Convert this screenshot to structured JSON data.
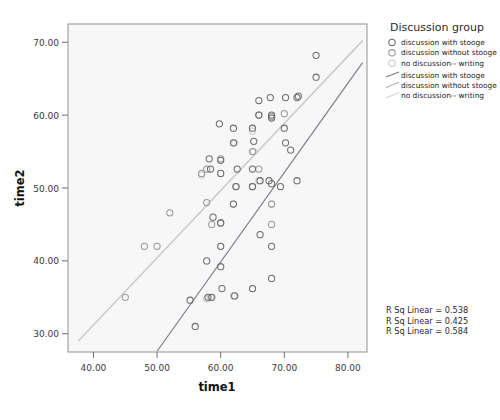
{
  "chart_data": {
    "type": "scatter",
    "title": "",
    "xlabel": "time1",
    "ylabel": "time2",
    "xlim": [
      36,
      83
    ],
    "ylim": [
      27.5,
      72.5
    ],
    "xticks": [
      "40.00",
      "50.00",
      "60.00",
      "70.00",
      "80.00"
    ],
    "xtick_values": [
      40,
      50,
      60,
      70,
      80
    ],
    "yticks": [
      "30.00",
      "40.00",
      "50.00",
      "60.00",
      "70.00"
    ],
    "ytick_values": [
      30,
      40,
      50,
      60,
      70
    ],
    "grid": false,
    "legend_position": "right",
    "legend_title": "Discussion group",
    "series": [
      {
        "name": "discussion with stooge",
        "marker": "open-circle",
        "color": "#6e6e6e",
        "points": [
          [
            56.0,
            31.0
          ],
          [
            55.2,
            34.6
          ],
          [
            58.0,
            35.0
          ],
          [
            58.6,
            35.0
          ],
          [
            60.2,
            36.2
          ],
          [
            62.2,
            35.2
          ],
          [
            65.0,
            36.2
          ],
          [
            68.0,
            37.6
          ],
          [
            57.8,
            40.0
          ],
          [
            60.0,
            39.2
          ],
          [
            60.0,
            42.0
          ],
          [
            68.0,
            42.0
          ],
          [
            66.2,
            43.6
          ],
          [
            60.0,
            45.2
          ],
          [
            58.8,
            46.0
          ],
          [
            62.0,
            47.8
          ],
          [
            62.4,
            50.2
          ],
          [
            65.0,
            50.2
          ],
          [
            66.2,
            51.0
          ],
          [
            67.6,
            51.0
          ],
          [
            68.0,
            50.6
          ],
          [
            69.4,
            50.2
          ],
          [
            72.0,
            51.0
          ],
          [
            60.0,
            52.0
          ],
          [
            62.6,
            52.6
          ],
          [
            65.0,
            52.6
          ],
          [
            58.4,
            52.6
          ],
          [
            60.0,
            53.8
          ],
          [
            58.2,
            54.0
          ],
          [
            62.0,
            56.2
          ],
          [
            65.2,
            56.4
          ],
          [
            70.2,
            56.2
          ],
          [
            59.8,
            58.8
          ],
          [
            62.0,
            58.2
          ],
          [
            65.0,
            58.2
          ],
          [
            70.0,
            58.2
          ],
          [
            66.0,
            60.0
          ],
          [
            68.0,
            60.0
          ],
          [
            68.0,
            59.6
          ],
          [
            71.0,
            55.2
          ],
          [
            66.0,
            62.0
          ],
          [
            67.8,
            62.4
          ],
          [
            70.2,
            62.4
          ],
          [
            72.0,
            62.4
          ],
          [
            72.2,
            62.6
          ],
          [
            75.0,
            65.2
          ],
          [
            75.0,
            68.2
          ]
        ]
      },
      {
        "name": "discussion without stooge",
        "marker": "open-circle",
        "color": "#9a9a9a",
        "points": [
          [
            45.0,
            35.0
          ],
          [
            48.0,
            42.0
          ],
          [
            50.0,
            42.0
          ],
          [
            52.0,
            46.6
          ],
          [
            57.8,
            48.0
          ],
          [
            58.6,
            45.0
          ],
          [
            60.0,
            45.2
          ],
          [
            57.0,
            52.0
          ],
          [
            57.8,
            52.6
          ],
          [
            60.0,
            54.0
          ],
          [
            62.4,
            50.2
          ],
          [
            65.0,
            50.2
          ],
          [
            65.0,
            55.0
          ],
          [
            66.0,
            52.6
          ],
          [
            68.0,
            45.0
          ],
          [
            68.0,
            47.8
          ],
          [
            66.0,
            60.0
          ],
          [
            68.0,
            59.8
          ],
          [
            70.0,
            60.2
          ]
        ]
      },
      {
        "name": "no discussion-- writing",
        "marker": "open-circle",
        "color": "#c9c9c9",
        "points": [
          [
            57.8,
            34.8
          ],
          [
            58.4,
            35.0
          ],
          [
            62.0,
            35.2
          ],
          [
            65.0,
            36.2
          ],
          [
            60.0,
            42.0
          ],
          [
            62.0,
            47.8
          ],
          [
            65.0,
            50.2
          ],
          [
            65.2,
            55.0
          ],
          [
            65.0,
            57.8
          ],
          [
            66.0,
            51.0
          ],
          [
            68.0,
            47.8
          ],
          [
            62.2,
            56.2
          ],
          [
            60.0,
            52.0
          ],
          [
            57.0,
            51.8
          ]
        ]
      }
    ],
    "fit_lines": [
      {
        "name": "discussion with stooge",
        "color": "#7a7a8a",
        "x_from": 50.0,
        "y_from": 27.6,
        "x_to": 82.3,
        "y_to": 67.2,
        "r_sq_linear": 0.538
      },
      {
        "name": "discussion without stooge",
        "color": "#b0b0b0",
        "x_from": 37.6,
        "y_from": 29.0,
        "x_to": 82.3,
        "y_to": 70.2,
        "r_sq_linear": 0.425
      },
      {
        "name": "no discussion-- writing",
        "color": "#d2d2d2",
        "x_from": 37.6,
        "y_from": 29.0,
        "x_to": 82.3,
        "y_to": 70.2,
        "r_sq_linear": 0.584
      }
    ],
    "annotations": [
      "R Sq Linear = 0.538",
      "R Sq Linear = 0.425",
      "R Sq Linear = 0.584"
    ]
  },
  "legend": {
    "title": "Discussion group",
    "marker_entries": [
      {
        "label": "discussion with stooge",
        "color": "#6e6e6e"
      },
      {
        "label": "discussion without stooge",
        "color": "#9a9a9a"
      },
      {
        "label": "no discussion-- writing",
        "color": "#c9c9c9"
      }
    ],
    "line_entries": [
      {
        "label": "discussion with stooge",
        "color": "#7a7a8a"
      },
      {
        "label": "discussion without stooge",
        "color": "#b0b0b0"
      },
      {
        "label": "no discussion-- writing",
        "color": "#d2d2d2"
      }
    ]
  },
  "plot_style": {
    "panel_background": "#f7f7f7",
    "panel_border": "#9b9b9b",
    "page_background": "#ffffff"
  }
}
